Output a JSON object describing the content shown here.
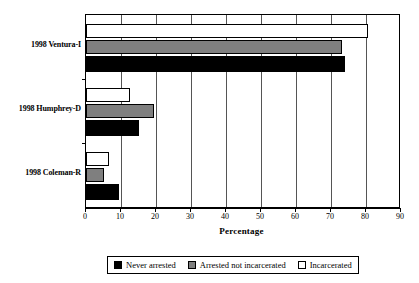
{
  "chart_data": {
    "type": "bar",
    "orientation": "horizontal",
    "title": "",
    "xlabel": "Percentage",
    "ylabel": "",
    "xlim": [
      0,
      90
    ],
    "xticks": [
      0,
      10,
      20,
      30,
      40,
      50,
      60,
      70,
      80,
      90
    ],
    "grid": true,
    "grid_axis": "x",
    "legend_position": "bottom",
    "categories": [
      "1998 Ventura-I",
      "1998 Humphrey-D",
      "1998 Coleman-R"
    ],
    "series": [
      {
        "name": "Never arrested",
        "color": "#000000",
        "values": [
          74,
          15,
          9.5
        ]
      },
      {
        "name": "Arrested not incarcerated",
        "color": "#7f7f7f",
        "values": [
          73,
          19.5,
          5
        ]
      },
      {
        "name": "Incarcerated",
        "color": "#ffffff",
        "values": [
          80.5,
          12.5,
          6.5
        ]
      }
    ]
  },
  "axis": {
    "x_title": "Percentage",
    "tick_labels": [
      "0",
      "10",
      "20",
      "30",
      "40",
      "50",
      "60",
      "70",
      "80",
      "90"
    ]
  },
  "categories": [
    {
      "label": "1998 Ventura-I"
    },
    {
      "label": "1998 Humphrey-D"
    },
    {
      "label": "1998 Coleman-R"
    }
  ],
  "legend": {
    "items": [
      {
        "label": "Never arrested",
        "swatch": "black-square-icon"
      },
      {
        "label": "Arrested not incarcerated",
        "swatch": "gray-square-icon"
      },
      {
        "label": "Incarcerated",
        "swatch": "white-square-icon"
      }
    ]
  }
}
